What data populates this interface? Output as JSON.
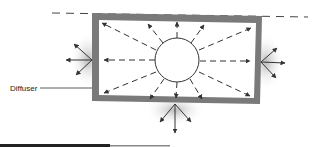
{
  "diagram": {
    "labels": {
      "diffuser": "Diffuser"
    },
    "colors": {
      "frame": "#7a7a7a",
      "arrow": "#333333",
      "glow": "#bdbdbd",
      "background": "#ffffff"
    },
    "elements": {
      "light_source": "circle",
      "frame": "rectangle-diffuser",
      "rays": "dashed-arrows-radiating",
      "scatter_points": [
        "left",
        "right",
        "bottom"
      ]
    }
  }
}
